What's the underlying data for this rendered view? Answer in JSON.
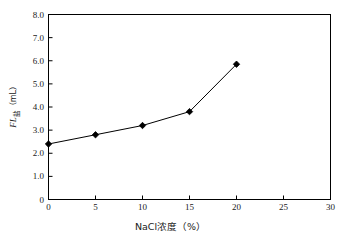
{
  "chart_data": {
    "type": "line",
    "title": "",
    "xlabel": "NaCl浓度（%）",
    "ylabel": "FL盐（mL）",
    "ylabel_parts": {
      "italic": "FL",
      "subscript": "盐",
      "unit": "（mL）"
    },
    "x": [
      0,
      5,
      10,
      15,
      20
    ],
    "values": [
      2.4,
      2.8,
      3.2,
      3.8,
      5.85
    ],
    "xlim": [
      0,
      30
    ],
    "ylim": [
      0,
      8
    ],
    "xticks": [
      0,
      5,
      10,
      15,
      20,
      25,
      30
    ],
    "xtick_labels": [
      "0",
      "5",
      "10",
      "15",
      "20",
      "25",
      "30"
    ],
    "yticks": [
      0,
      1,
      2,
      3,
      4,
      5,
      6,
      7,
      8
    ],
    "ytick_labels": [
      "0",
      "1.0",
      "2.0",
      "3.0",
      "4.0",
      "5.0",
      "6.0",
      "7.0",
      "8.0"
    ],
    "grid": false,
    "legend": null,
    "marker": "diamond",
    "marker_color": "#000000",
    "line_color": "#000000",
    "line_width": 1,
    "axis_color": "#000000",
    "background": "#ffffff",
    "series": [
      {
        "name": "FL盐",
        "points": [
          {
            "x": 0,
            "y": 2.4
          },
          {
            "x": 5,
            "y": 2.8
          },
          {
            "x": 10,
            "y": 3.2
          },
          {
            "x": 15,
            "y": 3.8
          },
          {
            "x": 20,
            "y": 5.85
          }
        ]
      }
    ]
  }
}
